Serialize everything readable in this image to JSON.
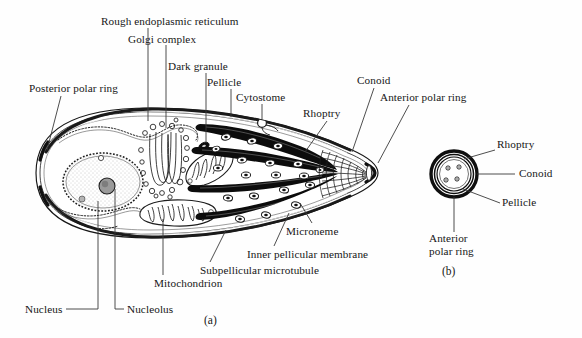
{
  "figure": {
    "panels": [
      {
        "id": "a",
        "caption": "(a)"
      },
      {
        "id": "b",
        "caption": "(b)"
      }
    ]
  },
  "panel_a": {
    "caption": "(a)",
    "labels": [
      {
        "key": "rough_er",
        "text": "Rough endoplasmic reticulum"
      },
      {
        "key": "golgi",
        "text": "Golgi complex"
      },
      {
        "key": "dark_granule",
        "text": "Dark granule"
      },
      {
        "key": "pellicle",
        "text": "Pellicle"
      },
      {
        "key": "cytostome",
        "text": "Cytostome"
      },
      {
        "key": "conoid",
        "text": "Conoid"
      },
      {
        "key": "rhoptry",
        "text": "Rhoptry"
      },
      {
        "key": "anterior_polar_ring",
        "text": "Anterior polar ring"
      },
      {
        "key": "posterior_polar_ring",
        "text": "Posterior polar ring"
      },
      {
        "key": "microneme",
        "text": "Microneme"
      },
      {
        "key": "inner_pellicular",
        "text": "Inner pellicular membrane"
      },
      {
        "key": "subpellicular",
        "text": "Subpellicular microtubule"
      },
      {
        "key": "mitochondrion",
        "text": "Mitochondrion"
      },
      {
        "key": "nucleolus",
        "text": "Nucleolus"
      },
      {
        "key": "nucleus",
        "text": "Nucleus"
      }
    ]
  },
  "panel_b": {
    "caption": "(b)",
    "labels": [
      {
        "key": "rhoptry",
        "text": "Rhoptry"
      },
      {
        "key": "conoid",
        "text": "Conoid"
      },
      {
        "key": "pellicle",
        "text": "Pellicle"
      },
      {
        "key": "anterior_polar_ring_line1",
        "text": "Anterior"
      },
      {
        "key": "anterior_polar_ring_line2",
        "text": "polar ring"
      }
    ]
  },
  "colors": {
    "ink": "#161616",
    "background": "#fefefe",
    "organelle_fill": "#ffffff",
    "rhoptry_fill": "#0d0d0d",
    "nucleoplasm": "#e8e8e8",
    "nucleolus": "#8f8f8f",
    "leader_line": "#3a3a3a"
  }
}
